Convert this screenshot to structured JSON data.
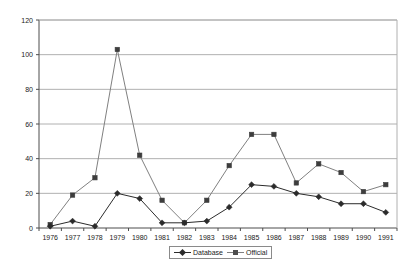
{
  "chart_data": {
    "type": "line",
    "title": "",
    "subtitle": "",
    "xlabel": "",
    "ylabel": "",
    "categories": [
      "1976",
      "1977",
      "1978",
      "1979",
      "1980",
      "1981",
      "1982",
      "1983",
      "1984",
      "1985",
      "1986",
      "1987",
      "1988",
      "1989",
      "1990",
      "1991"
    ],
    "yticks": [
      0,
      20,
      40,
      60,
      80,
      100,
      120
    ],
    "ylim": [
      0,
      120
    ],
    "grid": true,
    "legend_position": "bottom-center",
    "series": [
      {
        "name": "Database",
        "marker": "diamond",
        "color": "#2b2b2b",
        "values": [
          1,
          4,
          1,
          20,
          17,
          3,
          3,
          4,
          12,
          25,
          24,
          20,
          18,
          14,
          14,
          9
        ]
      },
      {
        "name": "Official",
        "marker": "square",
        "color": "#808080",
        "values": [
          2,
          19,
          29,
          103,
          42,
          16,
          3,
          16,
          36,
          54,
          54,
          26,
          37,
          32,
          21,
          25
        ]
      }
    ]
  },
  "legend": {
    "entries": [
      {
        "label": "Database"
      },
      {
        "label": "Official"
      }
    ]
  },
  "colors": {
    "series_database": "#2b2b2b",
    "series_official": "#808080",
    "gridline": "#b0b0b0",
    "axis": "#4d4d4d",
    "text": "#1a1a1a",
    "background": "#ffffff"
  }
}
